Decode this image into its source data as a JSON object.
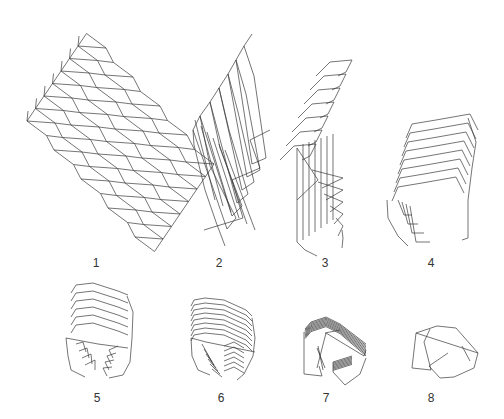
{
  "figure": {
    "stroke_color": "#3a3a3a",
    "background": "#ffffff",
    "panels": [
      {
        "id": 1,
        "label": "1",
        "x": 96,
        "y": 256
      },
      {
        "id": 2,
        "label": "2",
        "x": 219,
        "y": 256
      },
      {
        "id": 3,
        "label": "3",
        "x": 325,
        "y": 256
      },
      {
        "id": 4,
        "label": "4",
        "x": 431,
        "y": 256
      },
      {
        "id": 5,
        "label": "5",
        "x": 97,
        "y": 391
      },
      {
        "id": 6,
        "label": "6",
        "x": 221,
        "y": 391
      },
      {
        "id": 7,
        "label": "7",
        "x": 326,
        "y": 391
      },
      {
        "id": 8,
        "label": "8",
        "x": 431,
        "y": 391
      }
    ]
  }
}
